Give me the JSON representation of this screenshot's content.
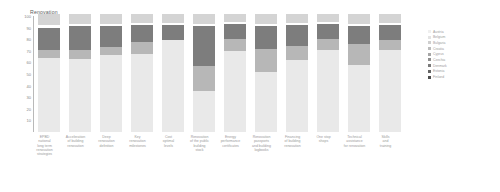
{
  "chart_data": {
    "type": "bar",
    "title": "Renovation",
    "subtitle": "",
    "xlabel": "",
    "ylabel": "",
    "ylim": [
      0,
      100
    ],
    "yticks": [
      100,
      90,
      80,
      70,
      60,
      50,
      40,
      30,
      20,
      10
    ],
    "grid": false,
    "stacked": true,
    "stack_mode": "percent",
    "legend_position": "right",
    "categories": [
      "EPBD\nnational\nlong term\nrenovation\nstrategies",
      "Acceleration\nof building\nrenovation",
      "Deep\nrenovation\ndefinition",
      "Key\nrenovation\nmilestones",
      "Cost\noptimal\nlevels",
      "Renovation\nof the public\nbuilding\nstock",
      "Energy\nperformance\ncertificates",
      "Renovation\npassports\nand building\nlogbooks",
      "Financing\nof building\nrenovation",
      "One stop\nshops",
      "Technical\nassistance\nfor renovation",
      "Skills\nand\ntraining"
    ],
    "categories_short": [
      "EPBD national long term renovation strategies",
      "Acceleration of building renovation",
      "Deep renovation definition",
      "Key renovation milestones",
      "Cost optimal levels",
      "Renovation of the public building stock",
      "Energy performance certificates",
      "Renovation passports and building logbooks",
      "Financing of building renovation",
      "One stop shops",
      "Technical assistance for renovation",
      "Skills and training"
    ],
    "series": [
      {
        "name": "Fully in place",
        "color": "#e9e9e9",
        "values": [
          64,
          63,
          66,
          67,
          79,
          35,
          70,
          52,
          62,
          71,
          58,
          71
        ]
      },
      {
        "name": "Largely in place",
        "color": "#b7b7b7",
        "values": [
          7,
          8,
          7,
          11,
          0,
          22,
          10,
          20,
          12,
          9,
          18,
          8
        ]
      },
      {
        "name": "Partially in place",
        "color": "#7d7d7d",
        "values": [
          19,
          20,
          18,
          14,
          13,
          34,
          13,
          19,
          18,
          13,
          15,
          13
        ]
      },
      {
        "name": "Not in place",
        "color": "#d4d4d4",
        "values": [
          10,
          9,
          9,
          8,
          8,
          9,
          7,
          9,
          8,
          7,
          9,
          8
        ]
      }
    ],
    "legend": [
      {
        "label": "Austria",
        "color": "#efefef"
      },
      {
        "label": "Belgium",
        "color": "#e3e3e3"
      },
      {
        "label": "Bulgaria",
        "color": "#cfcfcf"
      },
      {
        "label": "Croatia",
        "color": "#bcbcbc"
      },
      {
        "label": "Cyprus",
        "color": "#a6a6a6"
      },
      {
        "label": "Czechia",
        "color": "#909090"
      },
      {
        "label": "Denmark",
        "color": "#7a7a7a"
      },
      {
        "label": "Estonia",
        "color": "#646464"
      },
      {
        "label": "Finland",
        "color": "#4e4e4e"
      }
    ],
    "colors": {
      "base": "#e9e9e9",
      "mid": "#b7b7b7",
      "dark": "#7d7d7d",
      "cap": "#d4d4d4",
      "axis": "#b9b9b9",
      "text": "#8a8a8a",
      "title": "#5d5d5d",
      "background": "#ffffff"
    }
  }
}
